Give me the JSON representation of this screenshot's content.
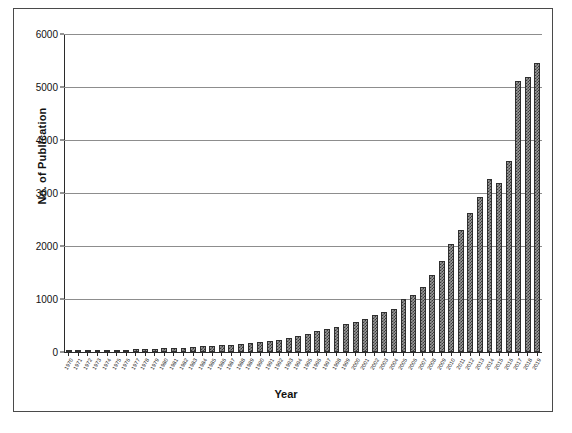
{
  "chart_data": {
    "type": "bar",
    "title": "",
    "xlabel": "Year",
    "ylabel": "No. of Publication",
    "ylim": [
      0,
      6000
    ],
    "ytick_values": [
      0,
      1000,
      2000,
      3000,
      4000,
      5000,
      6000
    ],
    "ytick_labels": [
      "0",
      "1000",
      "2000",
      "3000",
      "4000",
      "5000",
      "6000"
    ],
    "grid": true,
    "legend": "none",
    "categories": [
      "1970",
      "1971",
      "1972",
      "1973",
      "1974",
      "1975",
      "1976",
      "1977",
      "1978",
      "1979",
      "1980",
      "1981",
      "1982",
      "1983",
      "1984",
      "1985",
      "1986",
      "1987",
      "1988",
      "1989",
      "1990",
      "1991",
      "1992",
      "1993",
      "1994",
      "1995",
      "1996",
      "1997",
      "1998",
      "1999",
      "2000",
      "2001",
      "2002",
      "2003",
      "2004",
      "2005",
      "2006",
      "2007",
      "2008",
      "2009",
      "2010",
      "2011",
      "2012",
      "2013",
      "2014",
      "2015",
      "2016",
      "2017",
      "2018",
      "2019"
    ],
    "values": [
      10,
      18,
      22,
      30,
      35,
      38,
      45,
      50,
      55,
      60,
      70,
      78,
      85,
      95,
      105,
      115,
      125,
      140,
      150,
      165,
      180,
      200,
      230,
      260,
      300,
      340,
      390,
      430,
      470,
      520,
      560,
      620,
      700,
      760,
      820,
      1000,
      1080,
      1230,
      1460,
      1720,
      2040,
      2300,
      2620,
      2920,
      3270,
      3190,
      3600,
      4130,
      4270,
      4680
    ],
    "extra_values": [
      5120,
      5180,
      5450
    ]
  },
  "figure": {
    "border_color": "#4a4a4a",
    "bar_color": "#8f8f8f",
    "bar_edge_color": "#2f2f2f",
    "grid_color": "#8d8d8d",
    "axis_color": "#2b2b2b",
    "background": "#ffffff"
  }
}
